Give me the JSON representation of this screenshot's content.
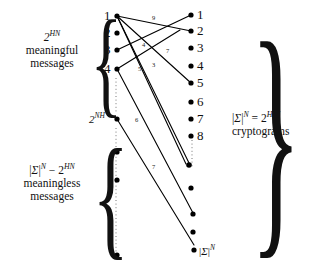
{
  "diagram": {
    "left_labels": {
      "top": {
        "line1": "2",
        "line1_sup": "HN",
        "line2": "meaningful",
        "line3": "messages"
      },
      "bottom": {
        "line1_a": "|",
        "line1_sigma": "Σ",
        "line1_b": "|",
        "line1_supN": "N",
        "line1_minus": " − 2",
        "line1_sup2": "HN",
        "line2": "meaningless",
        "line3": "messages"
      }
    },
    "right_label": {
      "line1_a": "|",
      "line1_sigma": "Σ",
      "line1_b": "|",
      "line1_supN": "N",
      "line1_eq": " = 2",
      "line1_sup2_base": "H",
      "line1_sup2_sub": "0",
      "line1_sup2_tail": "N",
      "line2": "cryptograms"
    },
    "left_column_numbers": [
      "1",
      "2",
      "3",
      "4"
    ],
    "left_mid_label": {
      "base": "2",
      "sup": "NH"
    },
    "right_column_numbers": [
      "1",
      "2",
      "3",
      "4",
      "5",
      "6",
      "7",
      "8"
    ],
    "right_bottom_label": {
      "a": "|",
      "sigma": "Σ",
      "b": "|",
      "supN": "N"
    },
    "edge_labels": [
      "9",
      "4",
      "7",
      "5",
      "3",
      "6",
      "7"
    ],
    "colors": {
      "ink": "#111111",
      "background": "#ffffff",
      "dot": "#000000"
    }
  }
}
